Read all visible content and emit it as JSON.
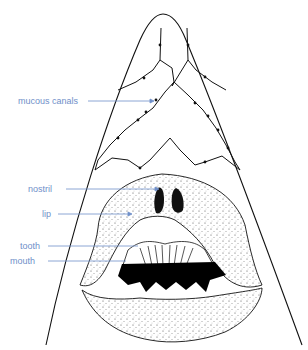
{
  "diagram": {
    "label_color": "#6f8fc9",
    "line_color": "#111111",
    "labels": [
      {
        "id": "mucous-canals",
        "text": "mucous canals"
      },
      {
        "id": "nostril",
        "text": "nostril"
      },
      {
        "id": "lip",
        "text": "lip"
      },
      {
        "id": "tooth",
        "text": "tooth"
      },
      {
        "id": "mouth",
        "text": "mouth"
      }
    ]
  }
}
